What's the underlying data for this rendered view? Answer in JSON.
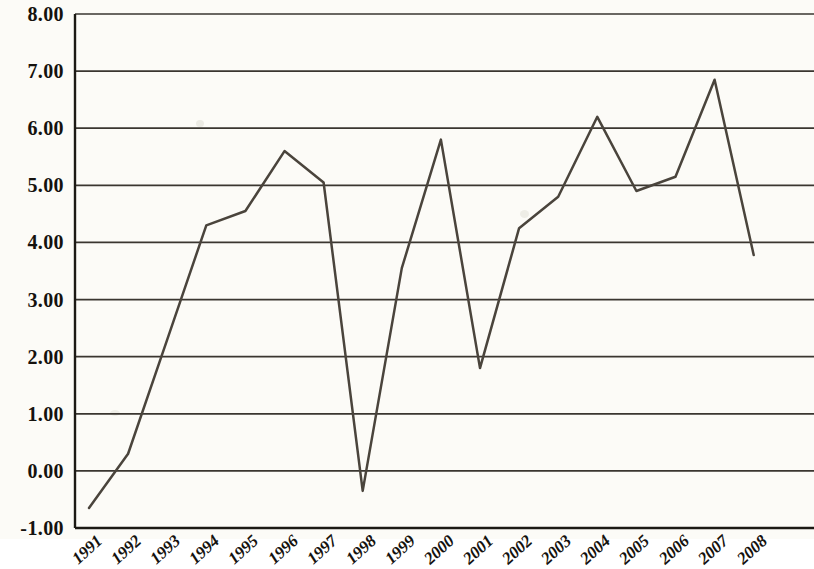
{
  "chart_data": {
    "type": "line",
    "title": "",
    "subtitle": "",
    "xlabel": "",
    "ylabel": "",
    "categories": [
      "1991",
      "1992",
      "1993",
      "1994",
      "1995",
      "1996",
      "1997",
      "1998",
      "1999",
      "2000",
      "2001",
      "2002",
      "2003",
      "2004",
      "2005",
      "2006",
      "2007",
      "2008"
    ],
    "values": [
      -0.65,
      0.3,
      2.3,
      4.3,
      4.55,
      5.6,
      5.05,
      -0.35,
      3.55,
      5.8,
      1.8,
      4.25,
      4.8,
      6.2,
      4.9,
      5.15,
      6.85,
      3.78
    ],
    "series": [
      {
        "name": "",
        "values": [
          -0.65,
          0.3,
          2.3,
          4.3,
          4.55,
          5.6,
          5.05,
          -0.35,
          3.55,
          5.8,
          1.8,
          4.25,
          4.8,
          6.2,
          4.9,
          5.15,
          6.85,
          3.78
        ]
      }
    ],
    "ylim": [
      -1.0,
      8.0
    ],
    "ytick_step": 1.0,
    "ytick_labels": [
      "8.00",
      "7.00",
      "6.00",
      "5.00",
      "4.00",
      "3.00",
      "2.00",
      "1.00",
      "0.00",
      "-1.00"
    ],
    "ytick_values": [
      8.0,
      7.0,
      6.0,
      5.0,
      4.0,
      3.0,
      2.0,
      1.0,
      0.0,
      -1.0
    ],
    "xtick_labels": [
      "1991",
      "1992",
      "1993",
      "1994",
      "1995",
      "1996",
      "1997",
      "1998",
      "1999",
      "2000",
      "2001",
      "2002",
      "2003",
      "2004",
      "2005",
      "2006",
      "2007",
      "2008"
    ],
    "grid": true,
    "grid_axis": "y",
    "legend": false,
    "legend_position": "none",
    "line_color": "#4a443c",
    "grid_color": "#2a2620",
    "axis_color": "#1c1914",
    "background_color": "#fcfbf7",
    "annotations": []
  }
}
